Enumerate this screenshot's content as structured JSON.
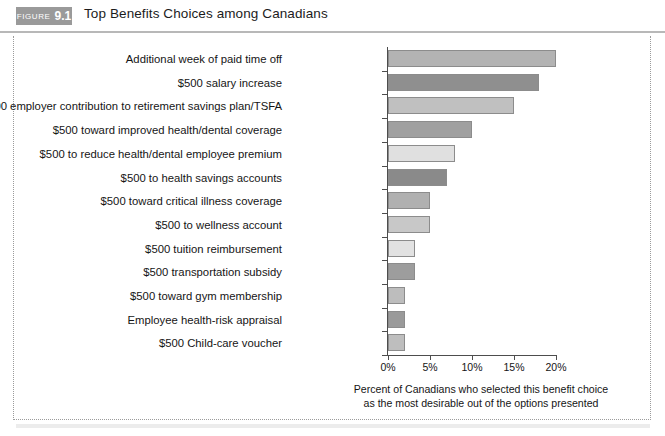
{
  "header": {
    "badge_word": "FIGURE",
    "badge_number": "9.1",
    "title": "Top Benefits Choices among Canadians"
  },
  "caption": {
    "line1": "Percent of Canadians who selected this benefit choice",
    "line2": "as the most desirable out of the options presented"
  },
  "chart_data": {
    "type": "bar",
    "orientation": "horizontal",
    "title": "Top Benefits Choices among Canadians",
    "xlabel": "Percent of Canadians who selected this benefit choice as the most desirable out of the options presented",
    "ylabel": "",
    "xlim": [
      0,
      20
    ],
    "xticks": [
      0,
      5,
      10,
      15,
      20
    ],
    "xticklabels": [
      "0%",
      "5%",
      "10%",
      "15%",
      "20%"
    ],
    "grid": false,
    "legend": false,
    "categories": [
      "Additional week of paid time off",
      "$500 salary increase",
      "$500 employer contribution to retirement savings plan/TSFA",
      "$500 toward improved health/dental coverage",
      "$500 to reduce health/dental employee premium",
      "$500 to health savings accounts",
      "$500 toward critical illness coverage",
      "$500 to wellness account",
      "$500 tuition reimbursement",
      "$500 transportation subsidy",
      "$500 toward gym membership",
      "Employee health-risk appraisal",
      "$500 Child-care voucher"
    ],
    "values": [
      20.0,
      18.0,
      15.0,
      10.0,
      8.0,
      7.0,
      5.0,
      5.0,
      3.2,
      3.2,
      2.0,
      2.0,
      2.0
    ],
    "bar_colors": [
      "#b3b3b3",
      "#8f8f8f",
      "#c0c0c0",
      "#a0a0a0",
      "#e0e0e0",
      "#8a8a8a",
      "#b0b0b0",
      "#c8c8c8",
      "#e2e2e2",
      "#9d9d9d",
      "#bdbdbd",
      "#9a9a9a",
      "#bebebe"
    ]
  }
}
